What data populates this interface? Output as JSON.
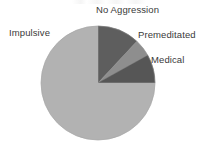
{
  "figure": {
    "width": 209,
    "height": 148,
    "background": "#ffffff"
  },
  "chart_data": {
    "type": "pie",
    "title": "",
    "subtitle": "",
    "xlabel": "",
    "ylabel": "",
    "grid": false,
    "legend_position": "none",
    "label_style": "direct-annotation",
    "labels": [
      "No Aggression",
      "Premeditated",
      "Medical",
      "Impulsive"
    ],
    "values": [
      12,
      5,
      8,
      75
    ],
    "unit": "percent",
    "total": 100,
    "start_angle_deg": 0,
    "direction": "clockwise",
    "center": {
      "x": 98,
      "y": 83
    },
    "radius": 57,
    "slices": [
      {
        "label": "No Aggression",
        "value": 12,
        "start_angle_deg": 0,
        "end_angle_deg": 43,
        "color": "#5e5e5e"
      },
      {
        "label": "Premeditated",
        "value": 5,
        "start_angle_deg": 43,
        "end_angle_deg": 61,
        "color": "#8e8e8e"
      },
      {
        "label": "Medical",
        "value": 8,
        "start_angle_deg": 61,
        "end_angle_deg": 90,
        "color": "#565656"
      },
      {
        "label": "Impulsive",
        "value": 75,
        "start_angle_deg": 90,
        "end_angle_deg": 360,
        "color": "#b2b2b2"
      }
    ],
    "outline_color": "#9a9a9a"
  },
  "annotations": {
    "no_aggression": "No Aggression",
    "impulsive": "Impulsive",
    "premeditated": "Premeditated",
    "medical": "Medical"
  },
  "colors": {
    "no_aggression": "#5e5e5e",
    "premeditated": "#8e8e8e",
    "medical": "#565656",
    "impulsive": "#b2b2b2",
    "label_text": "#3a3a3a",
    "background": "#ffffff"
  }
}
